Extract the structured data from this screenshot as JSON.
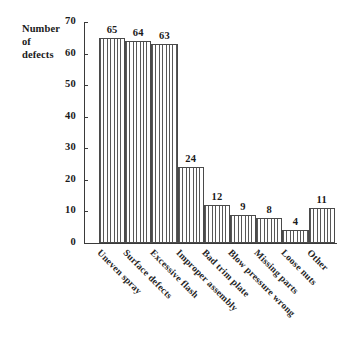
{
  "chart_data": {
    "type": "bar",
    "title": "",
    "xlabel": "",
    "ylabel": "Number of defects",
    "ylabel_lines": [
      "Number",
      "of",
      "defects"
    ],
    "ylim": [
      0,
      70
    ],
    "ytick_values": [
      0,
      10,
      20,
      30,
      40,
      50,
      60,
      70
    ],
    "ytick_labels": [
      "0",
      "10",
      "20",
      "30",
      "40",
      "50",
      "60",
      "70"
    ],
    "grid": false,
    "legend": false,
    "bar_style": "white with vertical line hatch, dark outline",
    "categories": [
      "Uneven spray",
      "Surface defects",
      "Excessive flash",
      "Improper assembly",
      "Bad trim plate",
      "Blow pressure wrong",
      "Missing parts",
      "Loose nuts",
      "Other"
    ],
    "values": [
      65,
      64,
      63,
      24,
      12,
      9,
      8,
      4,
      11
    ],
    "value_labels": [
      "65",
      "64",
      "63",
      "24",
      "12",
      "9",
      "8",
      "4",
      "11"
    ]
  },
  "colors": {
    "background": "#ffffff",
    "axis": "#3a3a3a",
    "text": "#1a1a1a",
    "bar_outline": "#4a4a4a",
    "bar_hatch": "#585858"
  }
}
